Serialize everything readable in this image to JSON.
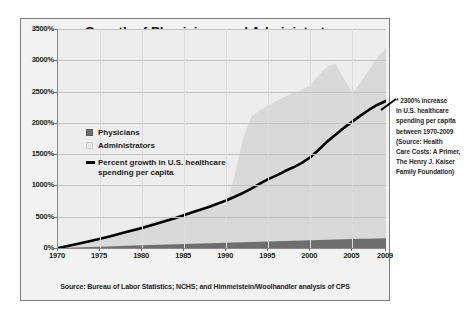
{
  "chart_data": {
    "type": "area",
    "title": "Growth of Physicians and Administrators",
    "subtitle": "1970-2009",
    "xlabel": "",
    "ylabel": "",
    "xlim": [
      1970,
      2009
    ],
    "ylim": [
      0,
      3500
    ],
    "grid": true,
    "legend_position": "inside-upper-left",
    "x_ticks": [
      "1970",
      "1975",
      "1980",
      "1985",
      "1990",
      "1995",
      "2000",
      "2005",
      "2009"
    ],
    "x_tick_values": [
      1970,
      1975,
      1980,
      1985,
      1990,
      1995,
      2000,
      2005,
      2009
    ],
    "y_ticks": [
      "0%",
      "500%",
      "1000%",
      "1500%",
      "2000%",
      "2500%",
      "3000%",
      "3500%"
    ],
    "y_tick_values": [
      0,
      500,
      1000,
      1500,
      2000,
      2500,
      3000,
      3500
    ],
    "x": [
      1970,
      1972,
      1974,
      1976,
      1978,
      1980,
      1982,
      1984,
      1986,
      1988,
      1990,
      1991,
      1992,
      1993,
      1994,
      1995,
      1996,
      1997,
      1998,
      1999,
      2000,
      2001,
      2002,
      2003,
      2004,
      2005,
      2006,
      2007,
      2008,
      2009
    ],
    "series": [
      {
        "name": "Administrators",
        "type": "area",
        "color": "#d9d9d9",
        "values": [
          0,
          60,
          130,
          200,
          280,
          360,
          450,
          520,
          600,
          660,
          700,
          1150,
          1750,
          2100,
          2200,
          2280,
          2350,
          2420,
          2480,
          2530,
          2600,
          2760,
          2900,
          2950,
          2700,
          2480,
          2650,
          2850,
          3050,
          3200
        ]
      },
      {
        "name": "Physicians",
        "type": "area",
        "color": "#6e6e6e",
        "values": [
          0,
          8,
          16,
          25,
          34,
          43,
          52,
          60,
          68,
          76,
          84,
          88,
          92,
          96,
          100,
          104,
          108,
          112,
          116,
          120,
          124,
          128,
          132,
          136,
          140,
          143,
          146,
          149,
          152,
          155
        ]
      },
      {
        "name": "Percent growth in U.S. healthcare spending per capita",
        "type": "line",
        "color": "#000000",
        "values": [
          0,
          55,
          115,
          180,
          250,
          320,
          400,
          480,
          570,
          660,
          760,
          820,
          880,
          950,
          1030,
          1100,
          1160,
          1230,
          1290,
          1360,
          1450,
          1570,
          1700,
          1810,
          1920,
          2020,
          2120,
          2210,
          2290,
          2350
        ]
      }
    ],
    "annotations": [
      {
        "name": "spending-callout",
        "lines": [
          "* 2300% increase",
          "in U.S. healthcare",
          "spending per capita",
          "between 1970-2009",
          "(Source: Health",
          "Care Costs: A Primer,",
          "The Henry J. Kaiser",
          "Family Foundation)"
        ]
      }
    ],
    "source_note": "Source: Bureau of Labor Statistics; NCHS; and Himmelstein/Woolhandler analysis of CPS"
  },
  "legend": {
    "items": [
      {
        "label": "Physicians",
        "swatch": "physicians"
      },
      {
        "label": "Administrators",
        "swatch": "administrators"
      },
      {
        "label": "Percent growth in U.S. healthcare",
        "label2": "spending per capita",
        "swatch": "line"
      }
    ]
  },
  "colors": {
    "administrators_fill": "#d9d9d9",
    "physicians_fill": "#6e6e6e",
    "spending_line": "#000000",
    "plot_background": "#ededed",
    "frame_background": "#f2f2f2",
    "gridline": "#c2c2c2"
  }
}
